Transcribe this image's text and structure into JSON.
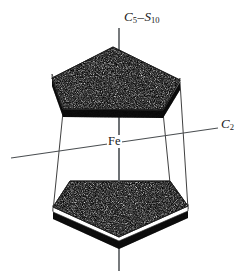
{
  "figure": {
    "background_color": "#ffffff",
    "ink_color": "#1a1a1a",
    "width": 251,
    "height": 279
  },
  "labels": {
    "principal_axis": {
      "full_text": "C5-S10",
      "symbol_1": "C",
      "sub_1": "5",
      "dash": "–",
      "symbol_2": "S",
      "sub_2": "10"
    },
    "secondary_axis": {
      "full_text": "C2",
      "symbol": "C",
      "sub": "2"
    },
    "metal_center": {
      "text": "Fe"
    }
  },
  "geometry": {
    "top_ring": {
      "name": "cyclopentadienyl-ring-top",
      "top_face_points": "113,47 180,80 163,110 63,109 52,78",
      "orientation": "apex-up",
      "fill": "stipple-dark",
      "side_band_color": "#ffffff",
      "rim_color": "#151515"
    },
    "bottom_ring": {
      "name": "cyclopentadienyl-ring-bottom",
      "top_face_points": "70,181 170,181 188,209 119,240 53,210",
      "orientation": "apex-down",
      "fill": "stipple-dark",
      "side_band_color": "#ffffff",
      "rim_color": "#151515"
    },
    "vertical_axis": {
      "x": 119,
      "y_top": 28,
      "y_bottom": 271
    },
    "horizontal_axis": {
      "x1": 11,
      "y1": 158,
      "x2": 218,
      "y2": 128
    },
    "connectors": [
      {
        "x1": 63,
        "y1": 112,
        "x2": 53,
        "y2": 211
      },
      {
        "x1": 163,
        "y1": 112,
        "x2": 170,
        "y2": 182
      },
      {
        "x1": 180,
        "y1": 82,
        "x2": 188,
        "y2": 208
      }
    ]
  }
}
